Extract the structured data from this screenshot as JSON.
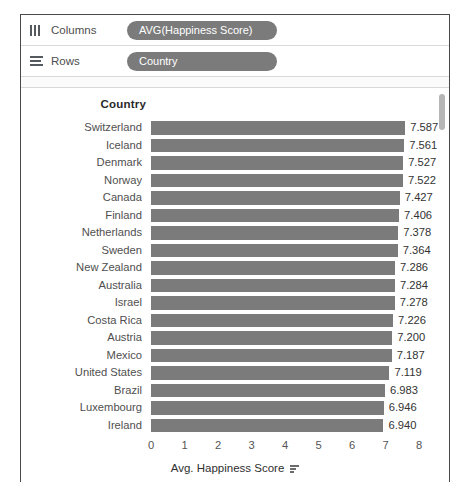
{
  "shelves": [
    {
      "icon": "columns-icon",
      "label": "Columns",
      "pill": "AVG(Happiness Score)"
    },
    {
      "icon": "rows-icon",
      "label": "Rows",
      "pill": "Country"
    }
  ],
  "view": {
    "row_header": "Country",
    "axis_title": "Avg. Happiness Score",
    "sort_icon": "sort-descending-icon",
    "scrollbar": "vertical-scrollbar"
  },
  "chart_data": {
    "type": "bar",
    "orientation": "horizontal",
    "title": "",
    "xlabel": "Avg. Happiness Score",
    "ylabel": "Country",
    "xlim": [
      0,
      8
    ],
    "xticks": [
      0,
      1,
      2,
      3,
      4,
      5,
      6,
      7,
      8
    ],
    "xtick_labels": [
      "0",
      "1",
      "2",
      "3",
      "4",
      "5",
      "6",
      "7",
      "8"
    ],
    "grid": false,
    "legend": "none",
    "bar_color": "#7b7b7b",
    "categories": [
      "Switzerland",
      "Iceland",
      "Denmark",
      "Norway",
      "Canada",
      "Finland",
      "Netherlands",
      "Sweden",
      "New Zealand",
      "Australia",
      "Israel",
      "Costa Rica",
      "Austria",
      "Mexico",
      "United States",
      "Brazil",
      "Luxembourg",
      "Ireland"
    ],
    "values": [
      7.587,
      7.561,
      7.527,
      7.522,
      7.427,
      7.406,
      7.378,
      7.364,
      7.286,
      7.284,
      7.278,
      7.226,
      7.2,
      7.187,
      7.119,
      6.983,
      6.946,
      6.94
    ],
    "value_labels": [
      "7.587",
      "7.561",
      "7.527",
      "7.522",
      "7.427",
      "7.406",
      "7.378",
      "7.364",
      "7.286",
      "7.284",
      "7.278",
      "7.226",
      "7.200",
      "7.187",
      "7.119",
      "6.983",
      "6.946",
      "6.940"
    ]
  }
}
